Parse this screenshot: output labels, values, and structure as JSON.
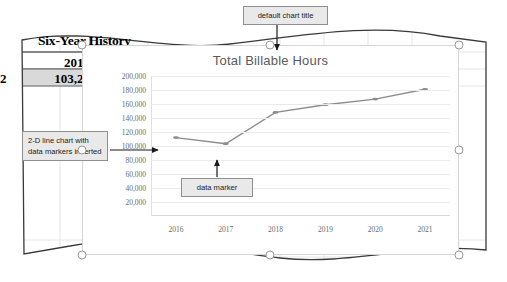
{
  "worksheet": {
    "title": "Six-Year History",
    "year_header": "2017",
    "row_label": "2",
    "value": "103,25"
  },
  "chart": {
    "title": "Total Billable Hours",
    "title_color": "#5a5a5a",
    "series_color": "#8c8c8c",
    "plot_background": "#ffffff",
    "border_color": "#d6d6d6",
    "selected": true,
    "handles": [
      {
        "name": "handle-top-left",
        "x": 82,
        "y": 45
      },
      {
        "name": "handle-top-center",
        "x": 270,
        "y": 45
      },
      {
        "name": "handle-top-right",
        "x": 459,
        "y": 45
      },
      {
        "name": "handle-middle-left",
        "x": 82,
        "y": 150
      },
      {
        "name": "handle-middle-right",
        "x": 459,
        "y": 150
      },
      {
        "name": "handle-bottom-left",
        "x": 82,
        "y": 255
      },
      {
        "name": "handle-bottom-center",
        "x": 270,
        "y": 255
      },
      {
        "name": "handle-bottom-right",
        "x": 459,
        "y": 255
      }
    ]
  },
  "chart_data": {
    "type": "line",
    "title": "Total Billable Hours",
    "xlabel": "",
    "ylabel": "",
    "categories": [
      "2016",
      "2017",
      "2018",
      "2019",
      "2020",
      "2021"
    ],
    "series": [
      {
        "name": "Total Billable Hours",
        "values": [
          112000,
          103250,
          148000,
          159000,
          167000,
          181000
        ],
        "marker": "circle",
        "color": "#8c8c8c"
      }
    ],
    "ylim": [
      0,
      200000
    ],
    "yticks": [
      20000,
      40000,
      60000,
      80000,
      100000,
      120000,
      140000,
      160000,
      180000,
      200000
    ],
    "ytick_labels": [
      "20,000",
      "40,000",
      "60,000",
      "80,000",
      "100,000",
      "120,000",
      "140,000",
      "160,000",
      "180,000",
      "200,000"
    ],
    "grid": true,
    "legend": false
  },
  "callouts": {
    "chart_title": "default chart title",
    "line_chart": "2-D line chart with data markers inserted",
    "data_marker": "data marker"
  }
}
